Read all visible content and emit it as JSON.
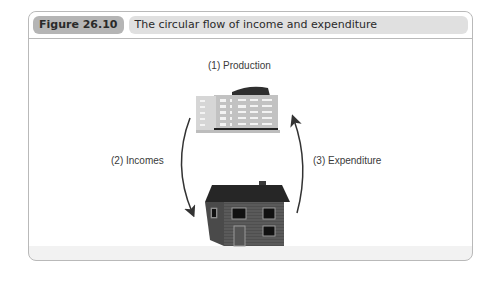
{
  "figure": {
    "number_label": "Figure 26.10",
    "title": "The circular flow of income and expenditure"
  },
  "diagram": {
    "nodes": [
      {
        "id": "firms",
        "icon": "office-building-icon",
        "label": "(1) Production"
      },
      {
        "id": "households",
        "icon": "house-icon"
      }
    ],
    "flows": [
      {
        "id": "incomes",
        "label": "(2) Incomes",
        "from": "firms",
        "to": "households",
        "direction": "downward-left-arc"
      },
      {
        "id": "expenditure",
        "label": "(3) Expenditure",
        "from": "households",
        "to": "firms",
        "direction": "upward-right-arc"
      }
    ],
    "colors": {
      "arrow": "#333333",
      "building": "#c4c4c4",
      "house": "#555555",
      "header_label_bg": "#b5b5b5",
      "header_title_bg": "#e0e0e0"
    }
  }
}
